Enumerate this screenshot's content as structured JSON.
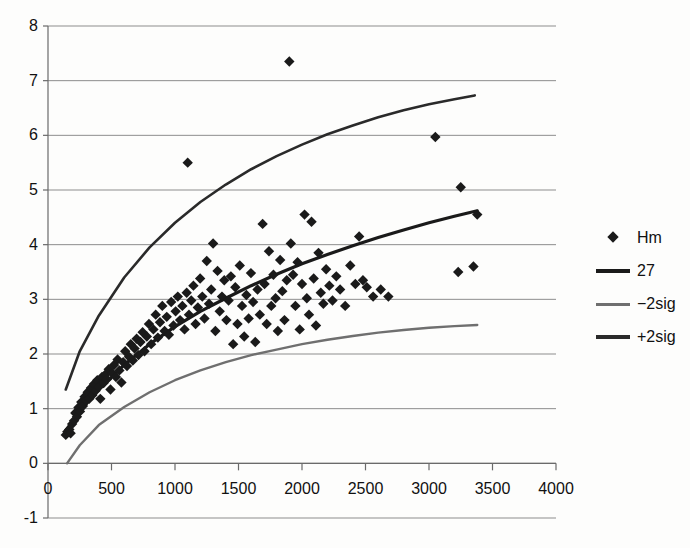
{
  "chart_data": {
    "type": "scatter",
    "title": "",
    "subtitle": "",
    "xlabel": "",
    "ylabel": "",
    "xlim": [
      0,
      4000
    ],
    "ylim": [
      -1,
      8
    ],
    "x_ticks": [
      0,
      500,
      1000,
      1500,
      2000,
      2500,
      3000,
      3500,
      4000
    ],
    "y_ticks": [
      -1,
      0,
      1,
      2,
      3,
      4,
      5,
      6,
      7,
      8
    ],
    "x_tick_labels": [
      "0",
      "500",
      "1000",
      "1500",
      "2000",
      "2500",
      "3000",
      "3500",
      "4000"
    ],
    "y_tick_labels": [
      "-1",
      "0",
      "1",
      "2",
      "3",
      "4",
      "5",
      "6",
      "7",
      "8"
    ],
    "grid": "horizontal",
    "legend_position": "right",
    "colors": {
      "marker": "#1a1a1a",
      "fit_line": "#1a1a1a",
      "upper_band": "#2a2a2a",
      "lower_band": "#6f6f6f",
      "gridline": "#8d8d8d",
      "axis": "#6a6a6a",
      "background": "#fdfdfc"
    },
    "series": [
      {
        "name": "Hm",
        "type": "scatter",
        "marker": "diamond",
        "color": "#1a1a1a",
        "points": [
          [
            140,
            0.52
          ],
          [
            152,
            0.58
          ],
          [
            168,
            0.62
          ],
          [
            178,
            0.55
          ],
          [
            190,
            0.72
          ],
          [
            205,
            0.78
          ],
          [
            215,
            0.92
          ],
          [
            228,
            0.85
          ],
          [
            240,
            1.02
          ],
          [
            252,
            0.95
          ],
          [
            262,
            1.12
          ],
          [
            275,
            1.05
          ],
          [
            288,
            1.22
          ],
          [
            300,
            1.15
          ],
          [
            312,
            1.3
          ],
          [
            325,
            1.18
          ],
          [
            338,
            1.38
          ],
          [
            350,
            1.25
          ],
          [
            362,
            1.45
          ],
          [
            375,
            1.33
          ],
          [
            388,
            1.52
          ],
          [
            400,
            1.4
          ],
          [
            412,
            1.18
          ],
          [
            425,
            1.58
          ],
          [
            438,
            1.47
          ],
          [
            450,
            1.62
          ],
          [
            465,
            1.54
          ],
          [
            478,
            1.72
          ],
          [
            492,
            1.35
          ],
          [
            505,
            1.65
          ],
          [
            520,
            1.8
          ],
          [
            535,
            1.58
          ],
          [
            548,
            1.9
          ],
          [
            562,
            1.7
          ],
          [
            578,
            1.48
          ],
          [
            592,
            1.85
          ],
          [
            608,
            2.05
          ],
          [
            622,
            1.78
          ],
          [
            638,
            1.95
          ],
          [
            652,
            2.18
          ],
          [
            668,
            1.88
          ],
          [
            682,
            2.1
          ],
          [
            698,
            2.28
          ],
          [
            712,
            1.98
          ],
          [
            728,
            2.22
          ],
          [
            745,
            2.4
          ],
          [
            760,
            2.05
          ],
          [
            778,
            2.32
          ],
          [
            795,
            2.55
          ],
          [
            812,
            2.18
          ],
          [
            830,
            2.45
          ],
          [
            848,
            2.72
          ],
          [
            865,
            2.3
          ],
          [
            882,
            2.58
          ],
          [
            900,
            2.88
          ],
          [
            918,
            2.42
          ],
          [
            935,
            2.68
          ],
          [
            952,
            2.35
          ],
          [
            970,
            2.95
          ],
          [
            988,
            2.52
          ],
          [
            1005,
            2.78
          ],
          [
            1022,
            3.05
          ],
          [
            1040,
            2.62
          ],
          [
            1058,
            2.88
          ],
          [
            1075,
            2.45
          ],
          [
            1092,
            3.12
          ],
          [
            1100,
            5.5
          ],
          [
            1110,
            2.72
          ],
          [
            1128,
            2.98
          ],
          [
            1145,
            3.25
          ],
          [
            1162,
            2.55
          ],
          [
            1180,
            2.85
          ],
          [
            1198,
            3.38
          ],
          [
            1215,
            3.05
          ],
          [
            1232,
            2.65
          ],
          [
            1250,
            3.7
          ],
          [
            1268,
            2.92
          ],
          [
            1285,
            3.18
          ],
          [
            1300,
            4.02
          ],
          [
            1318,
            2.42
          ],
          [
            1335,
            3.52
          ],
          [
            1352,
            2.78
          ],
          [
            1370,
            3.05
          ],
          [
            1388,
            3.35
          ],
          [
            1405,
            2.62
          ],
          [
            1422,
            2.98
          ],
          [
            1440,
            3.42
          ],
          [
            1458,
            2.18
          ],
          [
            1475,
            3.22
          ],
          [
            1492,
            2.55
          ],
          [
            1510,
            3.62
          ],
          [
            1528,
            2.88
          ],
          [
            1545,
            2.32
          ],
          [
            1562,
            3.08
          ],
          [
            1580,
            2.65
          ],
          [
            1598,
            3.48
          ],
          [
            1615,
            2.95
          ],
          [
            1632,
            2.22
          ],
          [
            1650,
            3.18
          ],
          [
            1668,
            2.72
          ],
          [
            1690,
            4.38
          ],
          [
            1705,
            3.28
          ],
          [
            1722,
            2.55
          ],
          [
            1740,
            3.88
          ],
          [
            1758,
            2.88
          ],
          [
            1775,
            3.45
          ],
          [
            1792,
            3.02
          ],
          [
            1810,
            2.42
          ],
          [
            1828,
            3.72
          ],
          [
            1845,
            3.15
          ],
          [
            1862,
            2.62
          ],
          [
            1880,
            3.35
          ],
          [
            1900,
            7.35
          ],
          [
            1912,
            4.02
          ],
          [
            1930,
            3.45
          ],
          [
            1948,
            2.88
          ],
          [
            1965,
            3.68
          ],
          [
            1982,
            2.45
          ],
          [
            2000,
            3.28
          ],
          [
            2020,
            4.55
          ],
          [
            2038,
            3.02
          ],
          [
            2055,
            2.72
          ],
          [
            2075,
            4.42
          ],
          [
            2092,
            3.38
          ],
          [
            2110,
            2.52
          ],
          [
            2130,
            3.85
          ],
          [
            2148,
            3.12
          ],
          [
            2168,
            2.92
          ],
          [
            2190,
            3.55
          ],
          [
            2215,
            3.25
          ],
          [
            2240,
            2.98
          ],
          [
            2270,
            3.42
          ],
          [
            2300,
            3.18
          ],
          [
            2340,
            2.88
          ],
          [
            2380,
            3.62
          ],
          [
            2420,
            3.28
          ],
          [
            2450,
            4.15
          ],
          [
            2480,
            3.35
          ],
          [
            2510,
            3.22
          ],
          [
            2560,
            3.05
          ],
          [
            2620,
            3.18
          ],
          [
            2680,
            3.05
          ],
          [
            3050,
            5.97
          ],
          [
            3230,
            3.5
          ],
          [
            3250,
            5.05
          ],
          [
            3350,
            3.6
          ],
          [
            3380,
            4.55
          ]
        ]
      },
      {
        "name": "27",
        "type": "line",
        "color": "#1a1a1a",
        "width": 3.2,
        "points": [
          [
            140,
            0.6
          ],
          [
            250,
            0.95
          ],
          [
            400,
            1.35
          ],
          [
            600,
            1.8
          ],
          [
            800,
            2.18
          ],
          [
            1000,
            2.5
          ],
          [
            1200,
            2.78
          ],
          [
            1400,
            3.02
          ],
          [
            1600,
            3.25
          ],
          [
            1800,
            3.46
          ],
          [
            2000,
            3.65
          ],
          [
            2200,
            3.82
          ],
          [
            2400,
            3.98
          ],
          [
            2600,
            4.13
          ],
          [
            2800,
            4.27
          ],
          [
            3000,
            4.4
          ],
          [
            3200,
            4.52
          ],
          [
            3380,
            4.62
          ]
        ]
      },
      {
        "name": "-2sig",
        "type": "line",
        "color": "#6f6f6f",
        "width": 2.4,
        "points": [
          [
            150,
            0.0
          ],
          [
            250,
            0.33
          ],
          [
            400,
            0.7
          ],
          [
            600,
            1.03
          ],
          [
            800,
            1.3
          ],
          [
            1000,
            1.52
          ],
          [
            1200,
            1.7
          ],
          [
            1400,
            1.85
          ],
          [
            1600,
            1.98
          ],
          [
            1800,
            2.08
          ],
          [
            2000,
            2.18
          ],
          [
            2200,
            2.26
          ],
          [
            2400,
            2.33
          ],
          [
            2600,
            2.39
          ],
          [
            2800,
            2.44
          ],
          [
            3000,
            2.48
          ],
          [
            3200,
            2.51
          ],
          [
            3380,
            2.53
          ]
        ]
      },
      {
        "name": "+2sig",
        "type": "line",
        "color": "#2a2a2a",
        "width": 2.6,
        "points": [
          [
            140,
            1.35
          ],
          [
            250,
            2.05
          ],
          [
            400,
            2.7
          ],
          [
            600,
            3.4
          ],
          [
            800,
            3.95
          ],
          [
            1000,
            4.4
          ],
          [
            1200,
            4.78
          ],
          [
            1400,
            5.1
          ],
          [
            1600,
            5.38
          ],
          [
            1800,
            5.62
          ],
          [
            2000,
            5.83
          ],
          [
            2200,
            6.02
          ],
          [
            2400,
            6.18
          ],
          [
            2600,
            6.33
          ],
          [
            2800,
            6.46
          ],
          [
            3000,
            6.57
          ],
          [
            3200,
            6.66
          ],
          [
            3360,
            6.73
          ]
        ]
      }
    ]
  },
  "legend": {
    "items": [
      {
        "label": "Hm",
        "swatch": "diamond-marker",
        "color": "#1a1a1a"
      },
      {
        "label": "27",
        "swatch": "thick-line",
        "color": "#1a1a1a"
      },
      {
        "label": "−2sig",
        "swatch": "thin-line",
        "color": "#6f6f6f"
      },
      {
        "label": "+2sig",
        "swatch": "thick-line",
        "color": "#2a2a2a"
      }
    ]
  }
}
